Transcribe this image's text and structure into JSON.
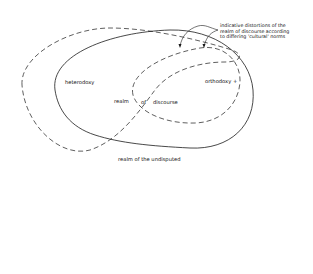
{
  "diagram": {
    "labels": {
      "heterodoxy": "heterodoxy",
      "orthodoxy": "orthodoxy +",
      "realm": "realm",
      "of": "of",
      "discourse": "discourse",
      "undisputed": "realm of the undisputed"
    },
    "annotation": {
      "line1": "indicative distortions of the",
      "line2": "realm of discourse according",
      "line3": "to differing 'cultural' norms"
    },
    "colors": {
      "stroke": "#1a1a1a",
      "background": "#ffffff"
    }
  }
}
